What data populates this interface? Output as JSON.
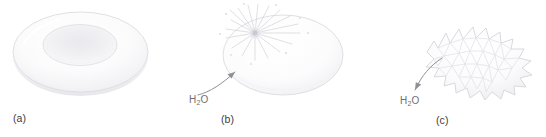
{
  "figure": {
    "background_color": "#ffffff",
    "outline_color": "#d8d8dc",
    "shade_color": "#ececf0",
    "label_color": "#3c3c3c",
    "annotation_color": "#6e6e72"
  },
  "panels": [
    {
      "id": "a",
      "label": "(a)",
      "cell_shape": "biconcave-disc",
      "annotation": null
    },
    {
      "id": "b",
      "label": "(b)",
      "cell_shape": "swollen-sphere-with-rupture",
      "annotation": {
        "text": "H2O",
        "text_main": "H",
        "text_sub": "2",
        "text_tail": "O",
        "arrow_direction": "into-cell"
      }
    },
    {
      "id": "c",
      "label": "(c)",
      "cell_shape": "crenated-spiky",
      "annotation": {
        "text": "H2O",
        "text_main": "H",
        "text_sub": "2",
        "text_tail": "O",
        "arrow_direction": "out-of-cell"
      }
    }
  ],
  "caption": {
    "clipped_text": ""
  }
}
